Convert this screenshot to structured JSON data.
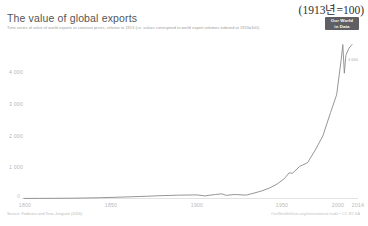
{
  "annotation": {
    "top_right": "(1913년=100)"
  },
  "badge": {
    "line1": "Our World",
    "line2": "in Data"
  },
  "header": {
    "title": "The value of global exports",
    "subtitle": "Time series of value of world exports at constant prices, relative to 1913 (i.e. values correspond to world export volumes indexed at 1913=100)."
  },
  "footer": {
    "source": "Source: Federico and Tena-Junguito (2016)",
    "attribution": "OurWorldInData.org/international-trade • CC BY-SA"
  },
  "end_label": "4 666",
  "chart_data": {
    "type": "line",
    "title": "The value of global exports",
    "subtitle": "Time series of value of world exports at constant prices, relative to 1913 (i.e. values correspond to world export volumes indexed at 1913=100).",
    "xlabel": "",
    "ylabel": "",
    "xlim": [
      1800,
      2014
    ],
    "ylim": [
      0,
      4400
    ],
    "grid": false,
    "legend": false,
    "line_color": "#8a8a8a",
    "y_ticks": [
      0,
      1000,
      2000,
      3000,
      4000
    ],
    "y_tick_labels": [
      "0",
      "1 000",
      "2 000",
      "3 000",
      "4 000"
    ],
    "x_ticks": [
      1800,
      1850,
      1900,
      1950,
      2000,
      2014
    ],
    "x_tick_labels": [
      "1800",
      "1850",
      "1900",
      "1950",
      "2000",
      "2014"
    ],
    "series": [
      {
        "name": "World exports (1913 = 100)",
        "x": [
          1800,
          1810,
          1820,
          1830,
          1840,
          1850,
          1860,
          1870,
          1880,
          1890,
          1900,
          1905,
          1910,
          1913,
          1918,
          1920,
          1925,
          1929,
          1932,
          1937,
          1938,
          1945,
          1950,
          1955,
          1960,
          1965,
          1970,
          1973,
          1975,
          1980,
          1985,
          1990,
          1995,
          2000,
          2004,
          2007,
          2008,
          2009,
          2010,
          2012,
          2014
        ],
        "y": [
          2,
          3,
          5,
          8,
          14,
          22,
          34,
          48,
          62,
          80,
          92,
          96,
          99,
          100,
          72,
          86,
          112,
          130,
          88,
          112,
          110,
          95,
          150,
          210,
          290,
          400,
          560,
          720,
          700,
          900,
          1000,
          1350,
          1750,
          2400,
          2900,
          3900,
          4300,
          3500,
          4000,
          4200,
          4300
        ]
      }
    ]
  }
}
